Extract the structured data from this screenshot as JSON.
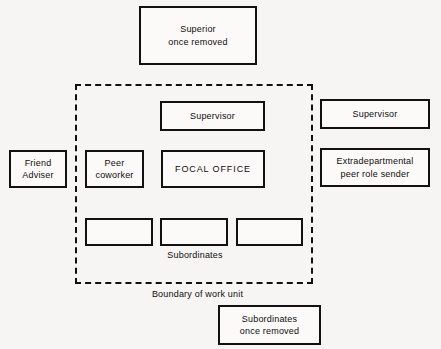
{
  "diagram": {
    "boundary": {
      "name": "work-unit-boundary",
      "caption": "Boundary of work unit",
      "style": "dashed"
    },
    "boxes": {
      "superior_once_removed": "Superior\nonce removed",
      "supervisor_inner": "Supervisor",
      "supervisor_outer": "Supervisor",
      "friend_adviser": "Friend\nAdviser",
      "peer_coworker": "Peer\ncoworker",
      "focal_office": "FOCAL OFFICE",
      "extradepartmental": "Extradepartmental\npeer role sender",
      "subordinate_1": "",
      "subordinate_2": "",
      "subordinate_3": "",
      "subordinates_once_removed": "Subordinates\nonce removed"
    },
    "labels": {
      "subordinates": "Subordinates",
      "boundary_of_work_unit": "Boundary of work unit"
    },
    "colors": {
      "background": "#f6f5f3",
      "box_fill": "#fbfaf8",
      "stroke": "#111111",
      "text": "#0d0d0d"
    }
  }
}
